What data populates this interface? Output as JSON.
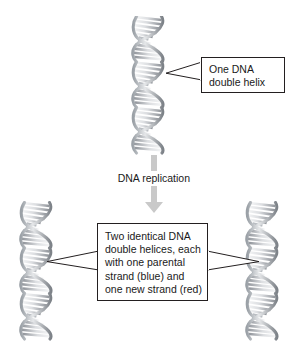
{
  "figure": {
    "background_color": "#ffffff",
    "width": 295,
    "height": 349
  },
  "callouts": {
    "top": {
      "text": "One DNA\ndouble helix",
      "lines": [
        "One DNA",
        "double helix"
      ],
      "border_color": "#231f20"
    },
    "bottom": {
      "text": "Two identical DNA\ndouble helices, each\nwith one parental\nstrand (blue) and\none new strand (red)",
      "lines": [
        "Two identical DNA",
        "double helices, each",
        "with one parental",
        "strand (blue) and",
        "one new strand (red)"
      ],
      "border_color": "#231f20"
    }
  },
  "process": {
    "label": "DNA replication",
    "arrow_color": "#c9c9c9"
  },
  "helices": {
    "parent": {
      "name": "parent-dna-double-helix"
    },
    "daughter_left": {
      "name": "daughter-dna-double-helix-left"
    },
    "daughter_right": {
      "name": "daughter-dna-double-helix-right"
    }
  },
  "colors": {
    "line": "#231f20",
    "text": "#1a1a1a",
    "arrow": "#c9c9c9",
    "helix_dark": "#6e7176",
    "helix_mid": "#a7abb0",
    "helix_light": "#e8eaec",
    "background": "#ffffff"
  }
}
